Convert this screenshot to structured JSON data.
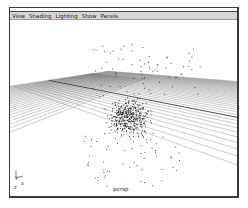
{
  "menubar": {
    "items": [
      {
        "label": "View"
      },
      {
        "label": "Shading"
      },
      {
        "label": "Lighting"
      },
      {
        "label": "Show"
      },
      {
        "label": "Panels"
      }
    ]
  },
  "viewport": {
    "camera_label": "persp",
    "axis_indicator": {
      "y": "y",
      "x": "x",
      "z": "z"
    },
    "content": "perspective grid with particle scatter cloud",
    "colors": {
      "grid": "#6a6a6a",
      "grid_axis": "#222222",
      "points": "#1a1a1a",
      "background": "#ffffff",
      "menubar": "#d6d6d6"
    }
  }
}
